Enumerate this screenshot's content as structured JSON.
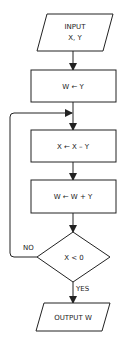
{
  "flowchart": {
    "input": {
      "line1": "INPUT",
      "line2": "X, Y"
    },
    "step1": "W ← Y",
    "step2": "X ← X – Y",
    "step3": "W ← W + Y",
    "decision": "X < 0",
    "no_label": "NO",
    "yes_label": "YES",
    "output": "OUTPUT W"
  },
  "colors": {
    "stroke": "#222222",
    "background": "#ffffff"
  }
}
